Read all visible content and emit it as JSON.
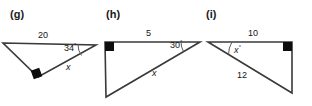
{
  "page": {
    "width": 312,
    "height": 106,
    "background": "#ffffff",
    "stroke_color": "#3a3a3a",
    "text_color": "#141414"
  },
  "figures": [
    {
      "id": "g",
      "label": "(g)",
      "label_x": 10,
      "label_y": 8,
      "description": "Triangle with horizontal top side of length 20, angle 34 degrees at right vertex, right angle at bottom vertex, unknown side x",
      "vertices": {
        "left": [
          3,
          43
        ],
        "right": [
          96,
          45
        ],
        "bottom": [
          38,
          77
        ]
      },
      "right_angle_marker": {
        "x": 32,
        "y": 70,
        "size": 9,
        "rotation": -20
      },
      "angle_arc": {
        "cx": 96,
        "cy": 45,
        "r": 18,
        "start_deg": 180,
        "end_deg": 214
      },
      "labels": [
        {
          "name": "side-top-length",
          "text": "20",
          "x": 38,
          "y": 30,
          "italic": false,
          "degree": false
        },
        {
          "name": "angle-value",
          "text": "34",
          "x": 64,
          "y": 42,
          "italic": false,
          "degree": true
        },
        {
          "name": "side-unknown",
          "text": "x",
          "x": 66,
          "y": 62,
          "italic": true,
          "degree": false
        }
      ]
    },
    {
      "id": "h",
      "label": "(h)",
      "label_x": 106,
      "label_y": 8,
      "description": "Right triangle with right angle at top-left, horizontal top side of length 5, angle 30 degrees at right vertex, hypotenuse x",
      "vertices": {
        "topleft": [
          105,
          42
        ],
        "right": [
          200,
          42
        ],
        "bottom": [
          106,
          97
        ]
      },
      "right_angle_marker": {
        "x": 105,
        "y": 42,
        "size": 9,
        "rotation": 0
      },
      "angle_arc": {
        "cx": 200,
        "cy": 42,
        "r": 19,
        "start_deg": 180,
        "end_deg": 210
      },
      "labels": [
        {
          "name": "side-top-length",
          "text": "5",
          "x": 146,
          "y": 28,
          "italic": false,
          "degree": false
        },
        {
          "name": "angle-value",
          "text": "30",
          "x": 170,
          "y": 39,
          "italic": false,
          "degree": true
        },
        {
          "name": "side-unknown",
          "text": "x",
          "x": 152,
          "y": 68,
          "italic": true,
          "degree": false
        }
      ]
    },
    {
      "id": "i",
      "label": "(i)",
      "label_x": 206,
      "label_y": 8,
      "description": "Right triangle with right angle at top-right, horizontal top side of length 10, hypotenuse of length 12, unknown angle x degrees at left vertex",
      "vertices": {
        "left": [
          208,
          42
        ],
        "topright": [
          292,
          42
        ],
        "bottomright": [
          292,
          93
        ]
      },
      "right_angle_marker": {
        "x": 283,
        "y": 42,
        "size": 9,
        "rotation": 0
      },
      "angle_arc": {
        "cx": 208,
        "cy": 42,
        "r": 24,
        "start_deg": 0,
        "end_deg": 31
      },
      "labels": [
        {
          "name": "side-top-length",
          "text": "10",
          "x": 248,
          "y": 28,
          "italic": false,
          "degree": false
        },
        {
          "name": "angle-unknown",
          "text": "x",
          "x": 234,
          "y": 44,
          "italic": true,
          "degree": true
        },
        {
          "name": "side-hypotenuse-length",
          "text": "12",
          "x": 237,
          "y": 70,
          "italic": false,
          "degree": false
        }
      ]
    }
  ]
}
